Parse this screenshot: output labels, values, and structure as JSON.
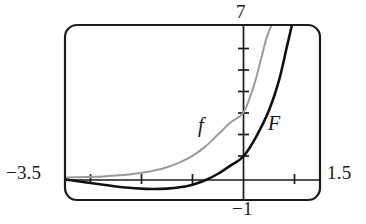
{
  "figure": {
    "background_color": "#ffffff",
    "frame": {
      "name": "calculator-viewport-frame",
      "x": 65,
      "y": 25,
      "width": 255,
      "height": 175,
      "corner_radius": 12,
      "stroke_color": "#1a1a1a",
      "stroke_width": 2.2
    }
  },
  "labels": {
    "x_min": "−3.5",
    "x_max": "1.5",
    "y_max": "7",
    "y_min": "−1",
    "curve_f": "f",
    "curve_F": "F"
  },
  "chart_data": {
    "type": "line",
    "title": "",
    "xlabel": "",
    "ylabel": "",
    "xlim": [
      -3.5,
      1.5
    ],
    "ylim": [
      -1,
      7
    ],
    "grid": false,
    "legend": "inline-curve-labels",
    "axes": {
      "x_axis_y_value": 0,
      "y_axis_x_value": 0,
      "x_tick_values": [
        -3,
        -2,
        -1,
        1
      ],
      "y_tick_values": [
        1,
        2,
        3,
        4,
        5,
        6
      ],
      "x_tick_interval": 1,
      "y_tick_interval": 1,
      "tick_length_px": 7,
      "axis_color": "#1a1a1a",
      "axis_width": 1.6
    },
    "series": [
      {
        "name": "f",
        "label": "f",
        "color": "#9a9a9a",
        "stroke_width": 2.0,
        "description": "exponential-type increasing curve, y-intercept near 3",
        "x": [
          -3.5,
          -3.25,
          -3.0,
          -2.75,
          -2.5,
          -2.25,
          -2.0,
          -1.75,
          -1.5,
          -1.25,
          -1.0,
          -0.75,
          -0.5,
          -0.25,
          0.0,
          0.2,
          0.35,
          0.45,
          0.55
        ],
        "y": [
          0.03,
          0.04,
          0.06,
          0.08,
          0.12,
          0.17,
          0.25,
          0.35,
          0.5,
          0.72,
          1.02,
          1.44,
          1.99,
          2.55,
          3.0,
          4.2,
          5.5,
          6.4,
          7.0
        ]
      },
      {
        "name": "F",
        "label": "F",
        "color": "#111111",
        "stroke_width": 2.6,
        "description": "antiderivative-type curve, dips below axis for negative x, y-intercept near 1",
        "x": [
          -3.5,
          -3.25,
          -3.0,
          -2.75,
          -2.5,
          -2.25,
          -2.0,
          -1.75,
          -1.5,
          -1.25,
          -1.0,
          -0.75,
          -0.5,
          -0.25,
          0.0,
          0.25,
          0.5,
          0.7,
          0.85,
          0.95
        ],
        "y": [
          -0.06,
          -0.14,
          -0.22,
          -0.3,
          -0.38,
          -0.44,
          -0.48,
          -0.5,
          -0.48,
          -0.42,
          -0.3,
          -0.1,
          0.2,
          0.58,
          1.0,
          1.9,
          3.1,
          4.5,
          6.0,
          7.0
        ]
      }
    ],
    "annotations": [
      {
        "text": "f",
        "x": -0.9,
        "y": 2.3
      },
      {
        "text": "F",
        "x": 0.55,
        "y": 2.45
      }
    ]
  }
}
